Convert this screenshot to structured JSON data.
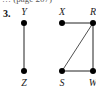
{
  "caption": "… (page 207)",
  "problem_number": "3.",
  "graph": {
    "vertices": [
      {
        "id": "Y",
        "label": "Y"
      },
      {
        "id": "Z",
        "label": "Z"
      },
      {
        "id": "X",
        "label": "X"
      },
      {
        "id": "R",
        "label": "R"
      },
      {
        "id": "S",
        "label": "S"
      },
      {
        "id": "W",
        "label": "W"
      }
    ],
    "edges": [
      [
        "Y",
        "Z"
      ],
      [
        "X",
        "R"
      ],
      [
        "R",
        "S"
      ],
      [
        "R",
        "W"
      ],
      [
        "S",
        "W"
      ]
    ]
  }
}
